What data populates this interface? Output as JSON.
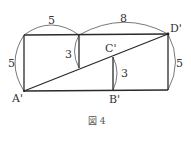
{
  "figure": {
    "caption": "図 4",
    "points": {
      "A": "A'",
      "B": "B'",
      "C": "C'",
      "D": "D'"
    },
    "measurements": {
      "top_left": "5",
      "top_right": "8",
      "left_side": "5",
      "middle_segment": "3",
      "cb_segment": "3",
      "right_side": "5"
    }
  }
}
